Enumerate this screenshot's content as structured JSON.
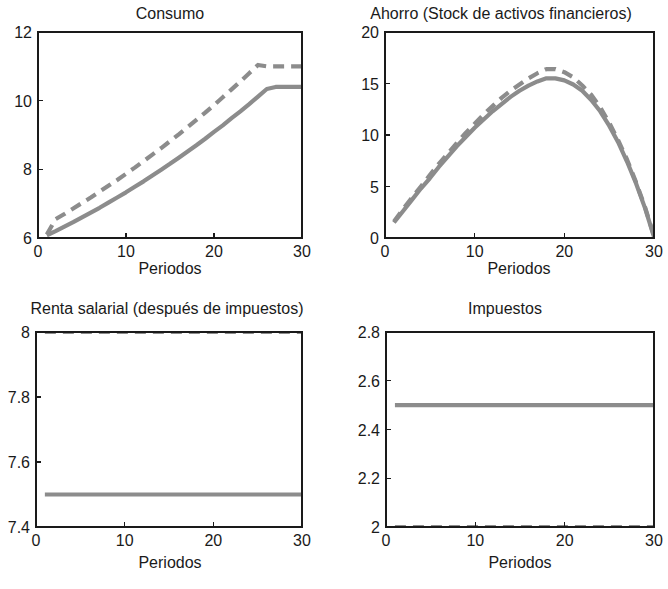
{
  "figure": {
    "background": "#ffffff",
    "series_color": "#8c8c8c",
    "axis_color": "#1a1a1a",
    "line_width": 4.2,
    "dash_pattern": "11,7"
  },
  "panels": [
    {
      "id": "consumo",
      "title": "Consumo",
      "xlabel": "Periodos",
      "ylabel": "",
      "xlim": [
        0,
        30
      ],
      "ylim": [
        6,
        12
      ],
      "xticks": [
        0,
        10,
        20,
        30
      ],
      "xticklabels": [
        "0",
        "10",
        "20",
        "30"
      ],
      "yticks": [
        6,
        8,
        10,
        12
      ],
      "yticklabels": [
        "6",
        "8",
        "10",
        "12"
      ]
    },
    {
      "id": "ahorro",
      "title": "Ahorro (Stock de activos financieros)",
      "xlabel": "Periodos",
      "ylabel": "",
      "xlim": [
        0,
        30
      ],
      "ylim": [
        0,
        20
      ],
      "xticks": [
        0,
        10,
        20,
        30
      ],
      "xticklabels": [
        "0",
        "10",
        "20",
        "30"
      ],
      "yticks": [
        0,
        5,
        10,
        15,
        20
      ],
      "yticklabels": [
        "0",
        "5",
        "10",
        "15",
        "20"
      ]
    },
    {
      "id": "renta-salarial",
      "title": "Renta salarial (después de impuestos)",
      "xlabel": "Periodos",
      "ylabel": "",
      "xlim": [
        0,
        30
      ],
      "ylim": [
        7.4,
        8
      ],
      "xticks": [
        0,
        10,
        20,
        30
      ],
      "xticklabels": [
        "0",
        "10",
        "20",
        "30"
      ],
      "yticks": [
        7.4,
        7.6,
        7.8,
        8
      ],
      "yticklabels": [
        "7.4",
        "7.6",
        "7.8",
        "8"
      ]
    },
    {
      "id": "impuestos",
      "title": "Impuestos",
      "xlabel": "Periodos",
      "ylabel": "",
      "xlim": [
        0,
        30
      ],
      "ylim": [
        2,
        2.8
      ],
      "xticks": [
        0,
        10,
        20,
        30
      ],
      "xticklabels": [
        "0",
        "10",
        "20",
        "30"
      ],
      "yticks": [
        2,
        2.2,
        2.4,
        2.6,
        2.8
      ],
      "yticklabels": [
        "2",
        "2.2",
        "2.4",
        "2.6",
        "2.8"
      ]
    }
  ],
  "chart_data": [
    {
      "type": "line",
      "panel": "consumo",
      "title": "Consumo",
      "xlabel": "Periodos",
      "ylabel": "",
      "xlim": [
        0,
        30
      ],
      "ylim": [
        6,
        12
      ],
      "grid": false,
      "legend": "none",
      "x": [
        1,
        2,
        3,
        4,
        5,
        6,
        7,
        8,
        9,
        10,
        11,
        12,
        13,
        14,
        15,
        16,
        17,
        18,
        19,
        20,
        21,
        22,
        23,
        24,
        25,
        26,
        27,
        28,
        29,
        30
      ],
      "series": [
        {
          "name": "escenario-base",
          "style": "solid",
          "color": "#8c8c8c",
          "values": [
            6.08,
            6.22,
            6.36,
            6.51,
            6.66,
            6.81,
            6.97,
            7.13,
            7.29,
            7.46,
            7.63,
            7.81,
            7.99,
            8.17,
            8.36,
            8.55,
            8.74,
            8.94,
            9.15,
            9.35,
            9.57,
            9.78,
            10.0,
            10.23,
            10.46,
            10.69,
            10.93,
            11.18,
            11.43,
            11.69
          ],
          "values_visible": [
            6.08,
            6.2,
            6.33,
            6.46,
            6.6,
            6.74,
            6.88,
            7.03,
            7.18,
            7.33,
            7.49,
            7.65,
            7.82,
            7.99,
            8.16,
            8.34,
            8.52,
            8.7,
            8.89,
            9.09,
            9.28,
            9.49,
            9.69,
            9.9,
            10.12,
            10.34,
            10.4,
            10.4,
            10.4,
            10.4
          ]
        },
        {
          "name": "escenario-alternativo",
          "style": "dashed",
          "color": "#8c8c8c",
          "values": [
            6.1,
            6.55,
            6.7,
            6.86,
            7.02,
            7.18,
            7.35,
            7.52,
            7.69,
            7.87,
            8.05,
            8.24,
            8.43,
            8.62,
            8.82,
            9.02,
            9.23,
            9.44,
            9.65,
            9.87,
            10.1,
            10.33,
            10.56,
            10.8,
            11.04,
            11.0,
            11.0,
            11.0,
            11.0,
            11.0
          ]
        }
      ]
    },
    {
      "type": "line",
      "panel": "ahorro",
      "title": "Ahorro (Stock de activos financieros)",
      "xlabel": "Periodos",
      "ylabel": "",
      "xlim": [
        0,
        30
      ],
      "ylim": [
        0,
        20
      ],
      "grid": false,
      "legend": "none",
      "x": [
        1,
        2,
        3,
        4,
        5,
        6,
        7,
        8,
        9,
        10,
        11,
        12,
        13,
        14,
        15,
        16,
        17,
        18,
        19,
        20,
        21,
        22,
        23,
        24,
        25,
        26,
        27,
        28,
        29,
        30
      ],
      "series": [
        {
          "name": "escenario-base",
          "style": "solid",
          "color": "#8c8c8c",
          "values": [
            1.5,
            2.6,
            3.7,
            4.8,
            5.8,
            6.9,
            7.9,
            8.9,
            9.8,
            10.7,
            11.5,
            12.3,
            13.0,
            13.7,
            14.3,
            14.8,
            15.2,
            15.5,
            15.5,
            15.3,
            14.9,
            14.3,
            13.4,
            12.3,
            10.9,
            9.3,
            7.4,
            5.3,
            2.9,
            0.1
          ]
        },
        {
          "name": "escenario-alternativo",
          "style": "dashed",
          "color": "#8c8c8c",
          "values": [
            1.6,
            2.8,
            3.9,
            5.0,
            6.1,
            7.2,
            8.2,
            9.2,
            10.2,
            11.1,
            12.0,
            12.8,
            13.6,
            14.3,
            14.9,
            15.5,
            16.0,
            16.4,
            16.4,
            16.1,
            15.6,
            14.8,
            13.9,
            12.7,
            11.2,
            9.5,
            7.6,
            5.4,
            3.0,
            0.2
          ]
        }
      ]
    },
    {
      "type": "line",
      "panel": "renta-salarial",
      "title": "Renta salarial (después de impuestos)",
      "xlabel": "Periodos",
      "ylabel": "",
      "xlim": [
        0,
        30
      ],
      "ylim": [
        7.4,
        8
      ],
      "grid": false,
      "legend": "none",
      "x": [
        1,
        2,
        3,
        4,
        5,
        6,
        7,
        8,
        9,
        10,
        11,
        12,
        13,
        14,
        15,
        16,
        17,
        18,
        19,
        20,
        21,
        22,
        23,
        24,
        25,
        26,
        27,
        28,
        29,
        30
      ],
      "series": [
        {
          "name": "escenario-base",
          "style": "solid",
          "color": "#8c8c8c",
          "constant": 7.5
        },
        {
          "name": "escenario-alternativo",
          "style": "dashed",
          "color": "#8c8c8c",
          "constant": 8.0
        }
      ]
    },
    {
      "type": "line",
      "panel": "impuestos",
      "title": "Impuestos",
      "xlabel": "Periodos",
      "ylabel": "",
      "xlim": [
        2,
        2.8
      ],
      "ylim": [
        2,
        2.8
      ],
      "grid": false,
      "legend": "none",
      "x": [
        1,
        2,
        3,
        4,
        5,
        6,
        7,
        8,
        9,
        10,
        11,
        12,
        13,
        14,
        15,
        16,
        17,
        18,
        19,
        20,
        21,
        22,
        23,
        24,
        25,
        26,
        27,
        28,
        29,
        30
      ],
      "series": [
        {
          "name": "escenario-base",
          "style": "solid",
          "color": "#8c8c8c",
          "constant": 2.5
        },
        {
          "name": "escenario-alternativo",
          "style": "dashed",
          "color": "#8c8c8c",
          "constant": 2.0
        }
      ]
    }
  ]
}
